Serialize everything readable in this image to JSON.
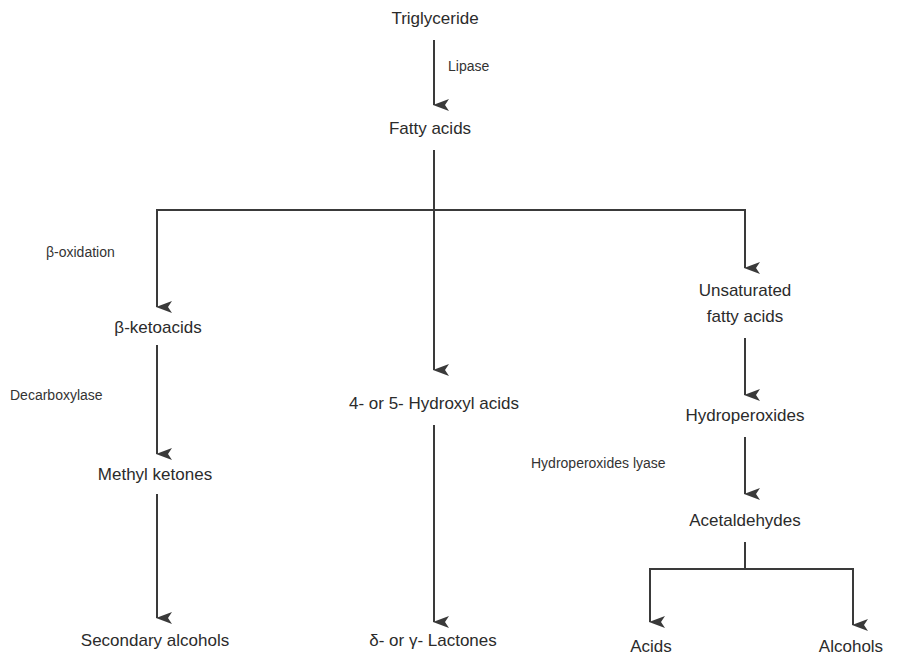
{
  "diagram": {
    "type": "flowchart",
    "nodes": {
      "triglyceride": "Triglyceride",
      "fatty_acids": "Fatty acids",
      "beta_ketoacids": "β-ketoacids",
      "methyl_ketones": "Methyl ketones",
      "secondary_alcohols": "Secondary alcohols",
      "hydroxyl_acids": "4- or 5- Hydroxyl acids",
      "lactones": "δ- or γ- Lactones",
      "unsaturated_line1": "Unsaturated",
      "unsaturated_line2": "fatty acids",
      "hydroperoxides": "Hydroperoxides",
      "acetaldehydes": "Acetaldehydes",
      "acids": "Acids",
      "alcohols": "Alcohols"
    },
    "edge_labels": {
      "lipase": "Lipase",
      "beta_oxidation": "β-oxidation",
      "decarboxylase": "Decarboxylase",
      "hydroperoxides_lyase": "Hydroperoxides lyase"
    },
    "edges": [
      {
        "from": "Triglyceride",
        "to": "Fatty acids",
        "label": "Lipase"
      },
      {
        "from": "Fatty acids",
        "to": "β-ketoacids",
        "label": "β-oxidation"
      },
      {
        "from": "Fatty acids",
        "to": "4- or 5- Hydroxyl acids",
        "label": ""
      },
      {
        "from": "Fatty acids",
        "to": "Unsaturated fatty acids",
        "label": ""
      },
      {
        "from": "β-ketoacids",
        "to": "Methyl ketones",
        "label": "Decarboxylase"
      },
      {
        "from": "Methyl ketones",
        "to": "Secondary alcohols",
        "label": ""
      },
      {
        "from": "4- or 5- Hydroxyl acids",
        "to": "δ- or γ- Lactones",
        "label": ""
      },
      {
        "from": "Unsaturated fatty acids",
        "to": "Hydroperoxides",
        "label": ""
      },
      {
        "from": "Hydroperoxides",
        "to": "Acetaldehydes",
        "label": "Hydroperoxides lyase"
      },
      {
        "from": "Acetaldehydes",
        "to": "Acids",
        "label": ""
      },
      {
        "from": "Acetaldehydes",
        "to": "Alcohols",
        "label": ""
      }
    ],
    "colors": {
      "line": "#3a3a3a",
      "text": "#2b2b2b",
      "background": "#ffffff"
    }
  }
}
